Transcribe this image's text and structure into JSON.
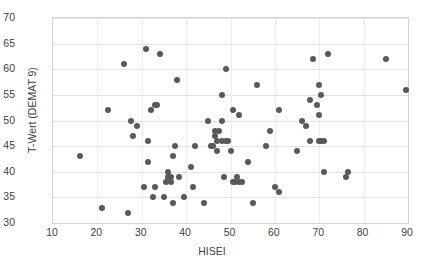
{
  "chart_data": {
    "type": "scatter",
    "title": "",
    "xlabel": "HISEI",
    "ylabel": "T-Wert (DEMAT 9)",
    "xlim": [
      10,
      90
    ],
    "ylim": [
      30,
      70
    ],
    "xticks": [
      10,
      20,
      30,
      40,
      50,
      60,
      70,
      80,
      90
    ],
    "yticks": [
      30,
      35,
      40,
      45,
      50,
      55,
      60,
      65,
      70
    ],
    "grid": "horizontal-and-vertical",
    "legend": "none",
    "marker_color": "#595959",
    "series": [
      {
        "name": "students",
        "points": [
          [
            16,
            43
          ],
          [
            21,
            33
          ],
          [
            22.5,
            52
          ],
          [
            26,
            61
          ],
          [
            27,
            32
          ],
          [
            27.5,
            50
          ],
          [
            28,
            47
          ],
          [
            29,
            49
          ],
          [
            30.5,
            37
          ],
          [
            31,
            64
          ],
          [
            31.5,
            46
          ],
          [
            31.5,
            42
          ],
          [
            32,
            52
          ],
          [
            32.5,
            35
          ],
          [
            33,
            37
          ],
          [
            33,
            53
          ],
          [
            33.5,
            53
          ],
          [
            34,
            63
          ],
          [
            35,
            35
          ],
          [
            35.5,
            38
          ],
          [
            36,
            40
          ],
          [
            36,
            39
          ],
          [
            36.5,
            38
          ],
          [
            36.5,
            39
          ],
          [
            37,
            43
          ],
          [
            37,
            34
          ],
          [
            37.5,
            45
          ],
          [
            38,
            58
          ],
          [
            38.5,
            39
          ],
          [
            39.5,
            35
          ],
          [
            41,
            41
          ],
          [
            41.5,
            37
          ],
          [
            42,
            45
          ],
          [
            44,
            34
          ],
          [
            45,
            50
          ],
          [
            45.5,
            45
          ],
          [
            46,
            45
          ],
          [
            46.5,
            48
          ],
          [
            46.5,
            47
          ],
          [
            47,
            46
          ],
          [
            47,
            44
          ],
          [
            47.5,
            48
          ],
          [
            48,
            46
          ],
          [
            48,
            50
          ],
          [
            48,
            55
          ],
          [
            48.5,
            39
          ],
          [
            49,
            46
          ],
          [
            49,
            60
          ],
          [
            49.5,
            46
          ],
          [
            50,
            44
          ],
          [
            50.5,
            38
          ],
          [
            50.5,
            52
          ],
          [
            51,
            38
          ],
          [
            51.5,
            39
          ],
          [
            52,
            38
          ],
          [
            52,
            51
          ],
          [
            52.5,
            38
          ],
          [
            54,
            42
          ],
          [
            55,
            34
          ],
          [
            56,
            57
          ],
          [
            58,
            45
          ],
          [
            59,
            48
          ],
          [
            60,
            37
          ],
          [
            61,
            36
          ],
          [
            61,
            52
          ],
          [
            65,
            44
          ],
          [
            66,
            50
          ],
          [
            67,
            49
          ],
          [
            68,
            54
          ],
          [
            68,
            46
          ],
          [
            68.5,
            62
          ],
          [
            69.5,
            53
          ],
          [
            70,
            57
          ],
          [
            70,
            51
          ],
          [
            70,
            46
          ],
          [
            70.5,
            46
          ],
          [
            70.5,
            55
          ],
          [
            71,
            46
          ],
          [
            71,
            40
          ],
          [
            72,
            63
          ],
          [
            76,
            39
          ],
          [
            76.5,
            40
          ],
          [
            85,
            62
          ],
          [
            89.5,
            56
          ]
        ]
      }
    ]
  }
}
